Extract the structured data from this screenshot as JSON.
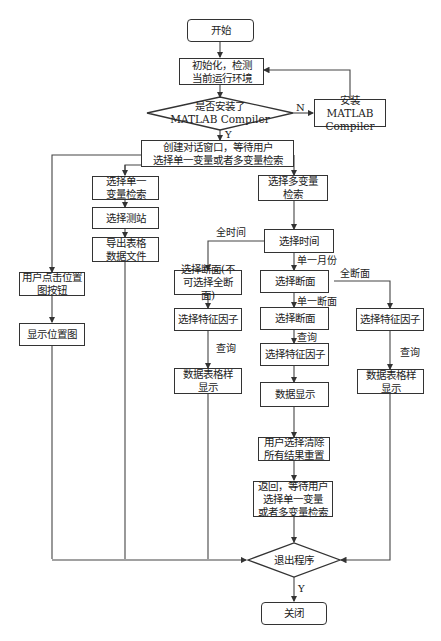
{
  "diagram": {
    "type": "flowchart",
    "nodes": {
      "start": "开始",
      "init": "初始化，检测\n当前运行环境",
      "check_installed": "是否安装了\nMATLAB Compiler",
      "install": "安装MATLAB\nCompiler",
      "create_dialog": "创建对话窗口，等待用户\n选择单一变量或者多变量检索",
      "single_var": "选择单一\n变量检索",
      "select_station": "选择测站",
      "export_table": "导出表格\n数据文件",
      "click_location": "用户点击位置\n图按钮",
      "show_location": "显示位置图",
      "multi_var": "选择多变量\n检索",
      "select_time": "选择时间",
      "select_section_all_time": "选择断面(不\n可选择全断面)",
      "select_factor_a": "选择特征因子",
      "table_display_a": "数据表格样\n显示",
      "select_section": "选择断面",
      "select_section_single": "选择断面",
      "select_factor_b": "选择特征因子",
      "data_display": "数据显示",
      "clear_reset": "用户选择清除\n所有结果重置",
      "return_wait": "返回，等待用户\n选择单一变量\n或者多变量检索",
      "select_factor_c": "选择特征因子",
      "table_display_c": "数据表格样\n显示",
      "exit_program": "退出程序",
      "close": "关闭"
    },
    "edge_labels": {
      "no": "N",
      "yes": "Y",
      "all_time": "全时间",
      "single_month": "单一月份",
      "all_sections": "全断面",
      "single_section": "单一断面",
      "query_a": "查询",
      "query_b": "查询",
      "query_c": "查询",
      "exit_yes": "Y"
    }
  }
}
